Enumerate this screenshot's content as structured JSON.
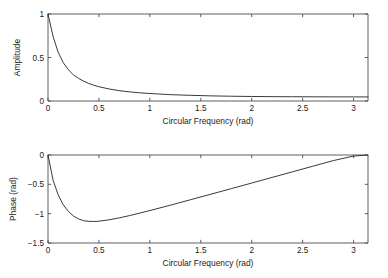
{
  "figure": {
    "background": "#ffffff",
    "line_color": "#3a3a3a",
    "axis_color": "#4d4d4d"
  },
  "chart_data": [
    {
      "type": "line",
      "title": "",
      "panel": "amplitude",
      "xlabel": "Circular Frequency (rad)",
      "ylabel": "Amplitude",
      "xlim": [
        0,
        3.14159
      ],
      "ylim": [
        0,
        1
      ],
      "xticks": [
        0,
        0.5,
        1,
        1.5,
        2,
        2.5,
        3
      ],
      "xticklabels": [
        "0",
        "0.5",
        "1",
        "1.5",
        "2",
        "2.5",
        "3"
      ],
      "yticks": [
        0,
        0.5,
        1
      ],
      "yticklabels": [
        "0",
        "0.5",
        "1"
      ],
      "grid": false,
      "legend": null,
      "series": [
        {
          "name": "Amplitude",
          "x": [
            0,
            0.05,
            0.1,
            0.15,
            0.2,
            0.25,
            0.3,
            0.35,
            0.4,
            0.45,
            0.5,
            0.6,
            0.7,
            0.8,
            0.9,
            1.0,
            1.2,
            1.4,
            1.6,
            1.8,
            2.0,
            2.2,
            2.4,
            2.6,
            2.8,
            3.0,
            3.14159
          ],
          "y": [
            1.0,
            0.74,
            0.56,
            0.44,
            0.36,
            0.3,
            0.26,
            0.228,
            0.202,
            0.181,
            0.164,
            0.138,
            0.119,
            0.105,
            0.094,
            0.086,
            0.073,
            0.065,
            0.059,
            0.055,
            0.052,
            0.05,
            0.049,
            0.048,
            0.0475,
            0.047,
            0.047
          ]
        }
      ]
    },
    {
      "type": "line",
      "title": "",
      "panel": "phase",
      "xlabel": "Circular Frequency (rad)",
      "ylabel": "Phase (rad)",
      "xlim": [
        0,
        3.14159
      ],
      "ylim": [
        -1.5,
        0
      ],
      "xticks": [
        0,
        0.5,
        1,
        1.5,
        2,
        2.5,
        3
      ],
      "xticklabels": [
        "0",
        "0.5",
        "1",
        "1.5",
        "2",
        "2.5",
        "3"
      ],
      "yticks": [
        -1.5,
        -1,
        -0.5,
        0
      ],
      "yticklabels": [
        "-1.5",
        "-1",
        "-0.5",
        "0"
      ],
      "grid": false,
      "legend": null,
      "series": [
        {
          "name": "Phase",
          "x": [
            0,
            0.05,
            0.1,
            0.15,
            0.2,
            0.25,
            0.3,
            0.35,
            0.4,
            0.45,
            0.5,
            0.6,
            0.7,
            0.8,
            0.9,
            1.0,
            1.2,
            1.4,
            1.6,
            1.8,
            2.0,
            2.2,
            2.4,
            2.6,
            2.8,
            3.0,
            3.14159
          ],
          "y": [
            0.0,
            -0.43,
            -0.68,
            -0.85,
            -0.96,
            -1.04,
            -1.09,
            -1.12,
            -1.131,
            -1.133,
            -1.128,
            -1.105,
            -1.072,
            -1.033,
            -0.991,
            -0.947,
            -0.856,
            -0.762,
            -0.668,
            -0.573,
            -0.478,
            -0.382,
            -0.287,
            -0.191,
            -0.096,
            -0.018,
            0.0
          ]
        }
      ]
    }
  ]
}
